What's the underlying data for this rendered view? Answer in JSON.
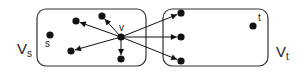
{
  "diagram": {
    "sets": [
      {
        "id": "Vs",
        "label_main": "V",
        "label_sub": "s",
        "box": {
          "x": 37,
          "y": 9,
          "w": 109,
          "h": 57,
          "r": 9
        },
        "label_pos": {
          "x": 17,
          "y": 54
        }
      },
      {
        "id": "Vt",
        "label_main": "V",
        "label_sub": "t",
        "box": {
          "x": 163,
          "y": 9,
          "w": 105,
          "h": 57,
          "r": 9
        },
        "label_pos": {
          "x": 276,
          "y": 57
        }
      }
    ],
    "nodes": [
      {
        "id": "v",
        "label": "v",
        "x": 121,
        "y": 37,
        "lx": 119,
        "ly": 31
      },
      {
        "id": "s",
        "label": "s",
        "x": 50,
        "y": 35,
        "lx": 45,
        "ly": 47
      },
      {
        "id": "a",
        "label": "",
        "x": 76,
        "y": 21
      },
      {
        "id": "b",
        "label": "",
        "x": 102,
        "y": 16
      },
      {
        "id": "c",
        "label": "",
        "x": 71,
        "y": 51
      },
      {
        "id": "d",
        "label": "",
        "x": 121,
        "y": 59
      },
      {
        "id": "e",
        "label": "",
        "x": 181,
        "y": 13
      },
      {
        "id": "f",
        "label": "",
        "x": 181,
        "y": 37
      },
      {
        "id": "g",
        "label": "",
        "x": 181,
        "y": 61
      },
      {
        "id": "t",
        "label": "t",
        "x": 253,
        "y": 26,
        "lx": 258,
        "ly": 21
      }
    ],
    "edges": [
      {
        "from": "v",
        "to": "a"
      },
      {
        "from": "v",
        "to": "b"
      },
      {
        "from": "v",
        "to": "c"
      },
      {
        "from": "v",
        "to": "d"
      },
      {
        "from": "v",
        "to": "e"
      },
      {
        "from": "v",
        "to": "f"
      },
      {
        "from": "v",
        "to": "g"
      }
    ]
  }
}
